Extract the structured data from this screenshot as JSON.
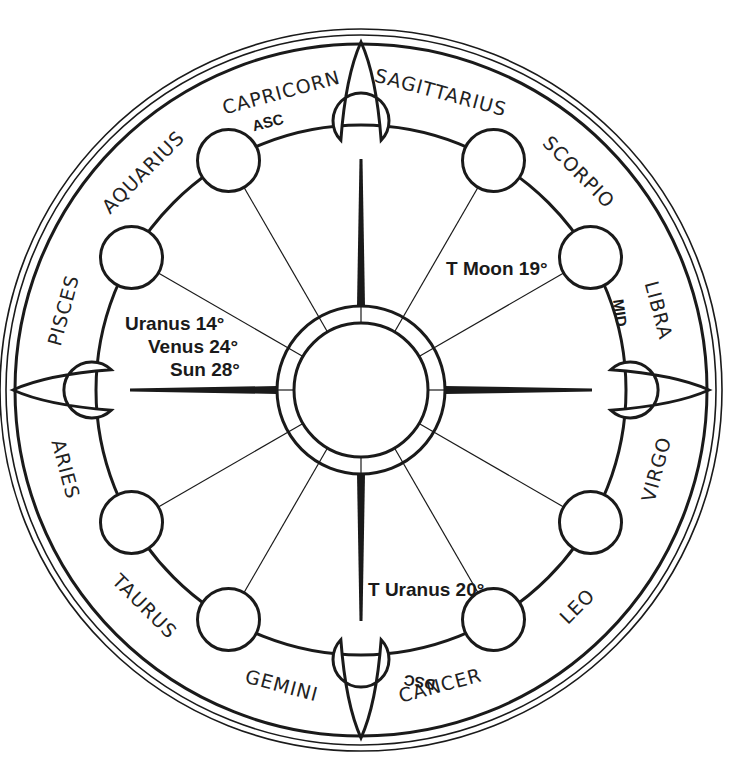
{
  "diagram": {
    "type": "astrological-chart-wheel",
    "colors": {
      "ink": "#1a1a1a",
      "background": "#ffffff"
    },
    "signs": [
      {
        "label": "CAPRICORN",
        "angle": 105
      },
      {
        "label": "SAGITTARIUS",
        "angle": 75
      },
      {
        "label": "SCORPIO",
        "angle": 45
      },
      {
        "label": "LIBRA",
        "angle": 15
      },
      {
        "label": "VIRGO",
        "angle": -15
      },
      {
        "label": "LEO",
        "angle": -45
      },
      {
        "label": "CANCER",
        "angle": -75
      },
      {
        "label": "GEMINI",
        "angle": -105
      },
      {
        "label": "TAURUS",
        "angle": -135
      },
      {
        "label": "ARIES",
        "angle": -165
      },
      {
        "label": "PISCES",
        "angle": 165
      },
      {
        "label": "AQUARIUS",
        "angle": 135
      }
    ],
    "angles": {
      "asc": "ASC",
      "mid": "MID",
      "dsc": "DSC"
    },
    "placements": {
      "natal_left": [
        "Uranus 14°",
        "Venus 24°",
        "Sun 28°"
      ],
      "transit_moon": "T Moon 19°",
      "transit_uranus": "T Uranus 20°"
    }
  }
}
